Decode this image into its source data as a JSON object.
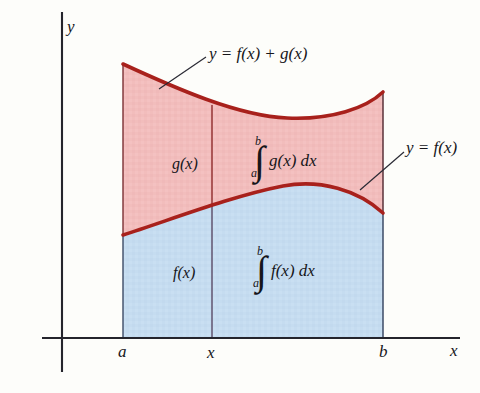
{
  "figure": {
    "kind": "calculus-area-between-curves-diagram",
    "background_color": "#fdfdfa",
    "axes": {
      "y_axis_label": "y",
      "x_axis_label": "x",
      "axis_color": "#24242c",
      "y_axis_x": 62,
      "x_axis_y": 338
    },
    "ticks": {
      "left_bound_label": "a",
      "mid_label": "x",
      "right_bound_label": "b",
      "left_bound_x": 123,
      "mid_x": 212,
      "right_bound_x": 383
    },
    "curves": {
      "upper_curve_label": "y = f(x) + g(x)",
      "lower_curve_label": "y = f(x)",
      "curve_color": "#a8211c",
      "upper_path": "M 123 64 C 175 88, 238 116, 287 118 C 332 120, 366 108, 383 92",
      "lower_path": "M 123 235 C 170 220, 232 196, 283 186 C 320 179, 358 190, 383 213"
    },
    "regions": {
      "upper_fill_color": "#f2bdbc",
      "lower_fill_color": "#c5dcf0",
      "upper_region_label": "g(x)",
      "lower_region_label": "f(x)",
      "upper_integral": {
        "integral_sign": "∫",
        "upper_limit": "b",
        "lower_limit": "a",
        "integrand": "g(x) dx"
      },
      "lower_integral": {
        "integral_sign": "∫",
        "upper_limit": "b",
        "lower_limit": "a",
        "integrand": "f(x) dx"
      }
    },
    "leaders": {
      "upper_leader_color": "#2a2a34",
      "lower_leader_color": "#2a2a34"
    }
  }
}
